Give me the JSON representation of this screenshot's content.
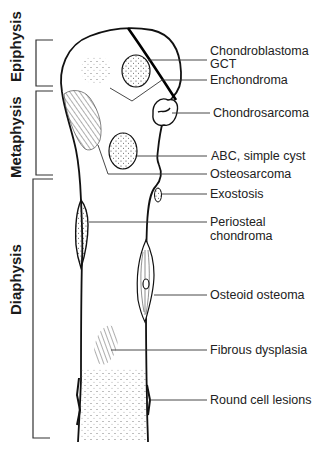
{
  "diagram": {
    "regions": [
      {
        "id": "epiphysis",
        "label": "Epiphysis"
      },
      {
        "id": "metaphysis",
        "label": "Metaphysis"
      },
      {
        "id": "diaphysis",
        "label": "Diaphysis"
      }
    ],
    "lesions": [
      {
        "id": "chondroblastoma",
        "label": "Chondroblastoma"
      },
      {
        "id": "gct",
        "label": "GCT"
      },
      {
        "id": "enchondroma",
        "label": "Enchondroma"
      },
      {
        "id": "chondrosarcoma",
        "label": "Chondrosarcoma"
      },
      {
        "id": "abc",
        "label": "ABC, simple cyst"
      },
      {
        "id": "osteosarcoma",
        "label": "Osteosarcoma"
      },
      {
        "id": "exostosis",
        "label": "Exostosis"
      },
      {
        "id": "periosteal_1",
        "label": "Periosteal"
      },
      {
        "id": "periosteal_2",
        "label": "chondroma"
      },
      {
        "id": "osteoid_osteoma",
        "label": "Osteoid osteoma"
      },
      {
        "id": "fibrous_dysplasia",
        "label": "Fibrous dysplasia"
      },
      {
        "id": "round_cell",
        "label": "Round cell lesions"
      }
    ]
  }
}
